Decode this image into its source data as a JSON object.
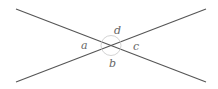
{
  "diagram": {
    "colors": {
      "line": "#555555",
      "arc": "#c8c8c8",
      "label": "#666666",
      "background": "#ffffff"
    },
    "lines": [
      {
        "name": "line-1",
        "x1": 16,
        "y1": 9,
        "x2": 206,
        "y2": 82
      },
      {
        "name": "line-2",
        "x1": 16,
        "y1": 82,
        "x2": 206,
        "y2": 9
      }
    ],
    "intersection": {
      "x": 111,
      "y": 45.5,
      "arc_radius": 10
    },
    "labels": {
      "a": "a",
      "b": "b",
      "c": "c",
      "d": "d"
    }
  }
}
